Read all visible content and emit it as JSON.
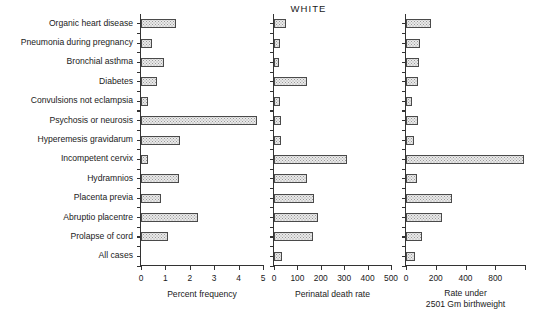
{
  "title": "WHITE",
  "chart_data": {
    "type": "bar",
    "title": "WHITE",
    "orientation": "horizontal",
    "grid": false,
    "legend": null,
    "categories": [
      "Organic heart disease",
      "Pneumonia during pregnancy",
      "Bronchial asthma",
      "Diabetes",
      "Convulsions not eclampsia",
      "Psychosis or neurosis",
      "Hyperemesis gravidarum",
      "Incompetent cervix",
      "Hydramnios",
      "Placenta previa",
      "Abruptio placentre",
      "Prolapse of cord",
      "All cases"
    ],
    "panels": [
      {
        "id": "percent-frequency",
        "xlabel": "Percent frequency",
        "xlabel_lines": [
          "Percent frequency"
        ],
        "xlim": [
          0,
          5
        ],
        "ticks": [
          0,
          1,
          2,
          3,
          4,
          5
        ],
        "ticklabels": [
          "0",
          "1",
          "2",
          "3",
          "4",
          "5"
        ],
        "values": [
          1.45,
          0.45,
          0.95,
          0.65,
          0.27,
          4.75,
          1.6,
          0.3,
          1.55,
          0.8,
          2.35,
          1.1,
          0.0
        ]
      },
      {
        "id": "perinatal-death-rate",
        "xlabel": "Perinatal death rate",
        "xlabel_lines": [
          "Perinatal death rate"
        ],
        "xlim": [
          0,
          500
        ],
        "ticks": [
          0,
          100,
          200,
          300,
          400,
          500
        ],
        "ticklabels": [
          "0",
          "100",
          "200",
          "300",
          "400",
          "500"
        ],
        "values": [
          52,
          26,
          22,
          140,
          24,
          32,
          30,
          310,
          140,
          170,
          190,
          165,
          33
        ]
      },
      {
        "id": "rate-under-2501-gm-birthweight",
        "xlabel": "Rate under 2501 Gm birthweight",
        "xlabel_lines": [
          "Rate under",
          "2501 Gm birthweight"
        ],
        "xlim": [
          0,
          800
        ],
        "ticks": [
          0,
          200,
          400,
          600,
          800
        ],
        "ticklabels": [
          "0",
          "200",
          "400",
          "800",
          ""
        ],
        "values": [
          165,
          92,
          90,
          82,
          38,
          78,
          52,
          795,
          72,
          310,
          245,
          110,
          58
        ]
      }
    ]
  }
}
